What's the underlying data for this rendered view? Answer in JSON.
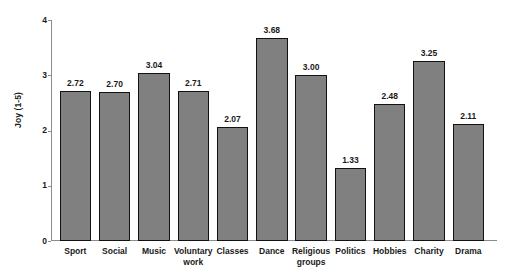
{
  "chart_data": {
    "type": "bar",
    "title": "",
    "xlabel": "",
    "ylabel": "Joy (1-5)",
    "ylim": [
      0,
      4
    ],
    "yticks": [
      "0",
      "1",
      "2",
      "3",
      "4"
    ],
    "grid": false,
    "legend": "none",
    "orientation": "vertical",
    "bar_color": "#808080",
    "bar_edge_color": "#121212",
    "axis_color": "#8c8c8c",
    "text_color": "#1a1a1a",
    "background": "#ffffff",
    "value_label_format": "2 decimal places, displayed above each bar",
    "categories": [
      "Sport",
      "Social",
      "Music",
      "Voluntary work",
      "Classes",
      "Dance",
      "Religious groups",
      "Politics",
      "Hobbies",
      "Charity",
      "Drama"
    ],
    "category_lines": [
      [
        "Sport"
      ],
      [
        "Social"
      ],
      [
        "Music"
      ],
      [
        "Voluntary",
        "work"
      ],
      [
        "Classes"
      ],
      [
        "Dance"
      ],
      [
        "Religious",
        "groups"
      ],
      [
        "Politics"
      ],
      [
        "Hobbies"
      ],
      [
        "Charity"
      ],
      [
        "Drama"
      ]
    ],
    "values": [
      2.72,
      2.7,
      3.04,
      2.71,
      2.07,
      3.68,
      3.0,
      1.33,
      2.48,
      3.25,
      2.11
    ],
    "value_labels": [
      "2.72",
      "2.70",
      "3.04",
      "2.71",
      "2.07",
      "3.68",
      "3.00",
      "1.33",
      "2.48",
      "3.25",
      "2.11"
    ]
  }
}
